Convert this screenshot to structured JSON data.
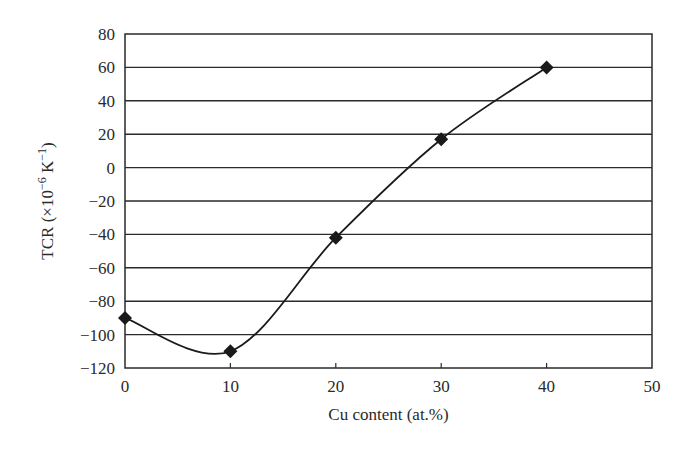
{
  "chart_data": {
    "type": "line",
    "title": "",
    "xlabel": "Cu content (at.%)",
    "ylabel": "TCR (×10⁻⁶ K⁻¹)",
    "ylabel_parts": {
      "prefix": "TCR (×10",
      "exp1": "−6",
      "mid": " K",
      "exp2": "−1",
      "suffix": ")"
    },
    "xlim": [
      0,
      50
    ],
    "ylim": [
      -120,
      80
    ],
    "x_ticks": [
      0,
      10,
      20,
      30,
      40,
      50
    ],
    "y_ticks": [
      80,
      60,
      40,
      20,
      0,
      -20,
      -40,
      -60,
      -80,
      -100,
      -120
    ],
    "x_tick_labels": [
      "0",
      "10",
      "20",
      "30",
      "40",
      "50"
    ],
    "y_tick_labels": [
      "80",
      "60",
      "40",
      "20",
      "0",
      "−20",
      "−40",
      "−60",
      "−80",
      "−100",
      "−120"
    ],
    "grid": {
      "horizontal": true,
      "vertical": false
    },
    "legend": null,
    "series": [
      {
        "name": "TCR",
        "marker": "diamond",
        "line": "smooth",
        "color": "#1a1a1a",
        "x": [
          0,
          10,
          20,
          30,
          40
        ],
        "y": [
          -90,
          -110,
          -42,
          17,
          60
        ]
      }
    ]
  },
  "colors": {
    "line": "#1a1a1a",
    "grid": "#2a2a2a",
    "text": "#2a2a2a",
    "background": "#ffffff"
  }
}
